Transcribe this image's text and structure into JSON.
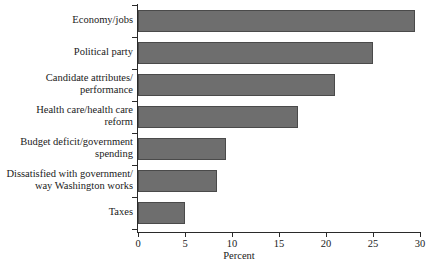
{
  "chart_data": {
    "type": "bar",
    "orientation": "horizontal",
    "title": "",
    "subtitle": "",
    "xlabel": "Percent",
    "ylabel": "",
    "xlim": [
      0,
      30
    ],
    "ylim": null,
    "grid": false,
    "legend": null,
    "legend_position": "none",
    "bar_color": "#6e6e6e",
    "bar_edge_color": "#4a4a4a",
    "axis_color": "#2a2a2a",
    "xticks": [
      0,
      5,
      10,
      15,
      20,
      25,
      30
    ],
    "xtick_labels": [
      "0",
      "5",
      "10",
      "15",
      "20",
      "25",
      "30"
    ],
    "categories": [
      "Economy/jobs",
      "Political party",
      "Candidate attributes/\nperformance",
      "Health care/health care\nreform",
      "Budget deficit/government\nspending",
      "Dissatisfied with government/\nway Washington works",
      "Taxes"
    ],
    "values": [
      29.5,
      25,
      21,
      17,
      9.4,
      8.4,
      5
    ]
  }
}
